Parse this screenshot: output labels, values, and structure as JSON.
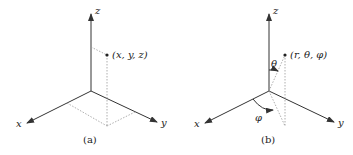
{
  "figures": [
    {
      "id": "a",
      "caption": "(a)",
      "axes": {
        "x": "x",
        "y": "y",
        "z": "z"
      },
      "point_label": "(x, y, z)",
      "description": "Cartesian coordinates"
    },
    {
      "id": "b",
      "caption": "(b)",
      "axes": {
        "x": "x",
        "y": "y",
        "z": "z"
      },
      "point_label": "(r, θ, φ)",
      "angle_labels": {
        "theta": "θ",
        "phi": "φ"
      },
      "description": "Spherical coordinates"
    }
  ],
  "colors": {
    "axis": "#333333",
    "guide": "#999999",
    "text": "#222222"
  }
}
